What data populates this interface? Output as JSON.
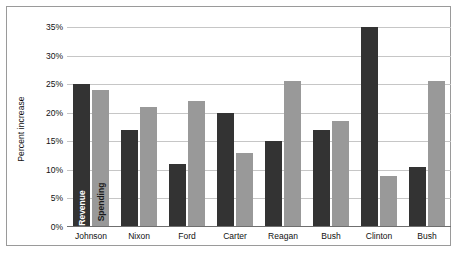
{
  "chart_data": {
    "type": "bar",
    "title": "",
    "xlabel": "",
    "ylabel": "Percent increase",
    "ylim": [
      0,
      35
    ],
    "grid": true,
    "legend_position": "inside-first-group-bars",
    "ytick_labels": [
      "35%",
      "30%",
      "25%",
      "20%",
      "15%",
      "10%",
      "5%",
      "0%"
    ],
    "ytick_values": [
      35,
      30,
      25,
      20,
      15,
      10,
      5,
      0
    ],
    "categories": [
      "Johnson",
      "Nixon",
      "Ford",
      "Carter",
      "Reagan",
      "Bush",
      "Clinton",
      "Bush"
    ],
    "series": [
      {
        "name": "Revenue",
        "color": "#333333",
        "values": [
          25,
          17,
          11,
          20,
          15,
          17,
          35,
          10.5
        ]
      },
      {
        "name": "Spending",
        "color": "#999999",
        "values": [
          24,
          21,
          22,
          13,
          25.5,
          18.5,
          9,
          25.5
        ]
      }
    ]
  }
}
